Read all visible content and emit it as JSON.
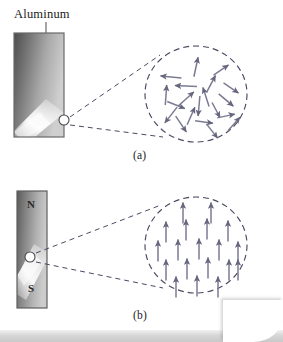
{
  "figure": {
    "title_label": "Aluminum",
    "panels": [
      {
        "id": "a",
        "caption": "(a)",
        "material_label": "Aluminum",
        "bar": {
          "kind": "aluminum-bar",
          "x": 14,
          "y": 33,
          "width": 50,
          "height": 104,
          "gradient": "dark-to-light-with-diagonal-highlight",
          "border_color": "#6a6a6a",
          "dark_color": "#4f4f4f",
          "light_color": "#f2f2f2"
        },
        "domain_marker": {
          "cx": 64,
          "cy": 120,
          "r": 5
        },
        "magnification_circle": {
          "cx": 196,
          "cy": 94,
          "rx": 51,
          "ry": 48,
          "style": "dashed",
          "stroke": "#5a5a72"
        },
        "domain_state": "randomly oriented magnetic domains",
        "arrow_color": "#7b7b93",
        "arrow_count": 20,
        "arrows": [
          {
            "x": 196,
            "y": 67,
            "angle": -78,
            "len": 20
          },
          {
            "x": 221,
            "y": 70,
            "angle": -34,
            "len": 18
          },
          {
            "x": 171,
            "y": 77,
            "angle": 186,
            "len": 21
          },
          {
            "x": 211,
            "y": 84,
            "angle": -62,
            "len": 19
          },
          {
            "x": 186,
            "y": 86,
            "angle": 182,
            "len": 22
          },
          {
            "x": 231,
            "y": 88,
            "angle": 34,
            "len": 18
          },
          {
            "x": 166,
            "y": 95,
            "angle": -86,
            "len": 20
          },
          {
            "x": 206,
            "y": 97,
            "angle": -108,
            "len": 20
          },
          {
            "x": 186,
            "y": 99,
            "angle": -42,
            "len": 21
          },
          {
            "x": 226,
            "y": 100,
            "angle": 40,
            "len": 19
          },
          {
            "x": 176,
            "y": 105,
            "angle": 22,
            "len": 19
          },
          {
            "x": 199,
            "y": 106,
            "angle": 95,
            "len": 20
          },
          {
            "x": 216,
            "y": 110,
            "angle": 62,
            "len": 17
          },
          {
            "x": 171,
            "y": 115,
            "angle": 128,
            "len": 20
          },
          {
            "x": 191,
            "y": 116,
            "angle": -66,
            "len": 19
          },
          {
            "x": 226,
            "y": 116,
            "angle": -12,
            "len": 18
          },
          {
            "x": 181,
            "y": 124,
            "angle": 56,
            "len": 19
          },
          {
            "x": 204,
            "y": 122,
            "angle": 8,
            "len": 18
          },
          {
            "x": 234,
            "y": 124,
            "angle": -48,
            "len": 18
          },
          {
            "x": 212,
            "y": 131,
            "angle": 52,
            "len": 18
          }
        ]
      },
      {
        "id": "b",
        "caption": "(b)",
        "pole_north": "N",
        "pole_south": "S",
        "bar": {
          "kind": "bar-magnet",
          "x": 17,
          "y": 191,
          "width": 30,
          "height": 117,
          "gradient": "dark-to-light-with-diagonal-highlight",
          "border_color": "#5e5e5e",
          "dark_color": "#545454",
          "light_color": "#ededed"
        },
        "domain_marker": {
          "cx": 30,
          "cy": 257,
          "r": 5
        },
        "magnification_circle": {
          "cx": 196,
          "cy": 245,
          "rx": 51,
          "ry": 48,
          "style": "dashed",
          "stroke": "#5a5a72"
        },
        "domain_state": "aligned magnetic domains",
        "arrow_color": "#7b7b93",
        "arrow_count": 19,
        "arrows": [
          {
            "x": 183,
            "y": 213,
            "angle": -90,
            "len": 21
          },
          {
            "x": 211,
            "y": 213,
            "angle": -90,
            "len": 21
          },
          {
            "x": 166,
            "y": 232,
            "angle": -90,
            "len": 21
          },
          {
            "x": 186,
            "y": 230,
            "angle": -90,
            "len": 21
          },
          {
            "x": 207,
            "y": 229,
            "angle": -90,
            "len": 21
          },
          {
            "x": 228,
            "y": 231,
            "angle": -90,
            "len": 21
          },
          {
            "x": 158,
            "y": 251,
            "angle": -90,
            "len": 21
          },
          {
            "x": 178,
            "y": 250,
            "angle": -90,
            "len": 21
          },
          {
            "x": 199,
            "y": 249,
            "angle": -90,
            "len": 21
          },
          {
            "x": 219,
            "y": 250,
            "angle": -90,
            "len": 21
          },
          {
            "x": 238,
            "y": 252,
            "angle": -90,
            "len": 21
          },
          {
            "x": 166,
            "y": 270,
            "angle": -90,
            "len": 21
          },
          {
            "x": 187,
            "y": 269,
            "angle": -90,
            "len": 21
          },
          {
            "x": 208,
            "y": 268,
            "angle": -90,
            "len": 21
          },
          {
            "x": 229,
            "y": 270,
            "angle": -90,
            "len": 21
          },
          {
            "x": 176,
            "y": 287,
            "angle": -90,
            "len": 21
          },
          {
            "x": 197,
            "y": 286,
            "angle": -90,
            "len": 21
          },
          {
            "x": 218,
            "y": 287,
            "angle": -90,
            "len": 21
          },
          {
            "x": 238,
            "y": 270,
            "angle": -90,
            "len": 21
          }
        ]
      }
    ]
  }
}
